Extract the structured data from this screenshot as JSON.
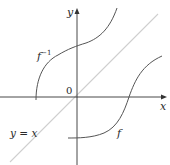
{
  "diagram": {
    "type": "function-and-inverse-graph",
    "axes": {
      "x_label": "x",
      "y_label": "y",
      "origin_label": "0"
    },
    "curves": {
      "identity_label": "y = x",
      "f_label": "f",
      "f_inverse_base": "f",
      "f_inverse_sup": "−1"
    },
    "colors": {
      "axis": "#333333",
      "curve": "#555555",
      "identity_line": "#c8c8c8",
      "text": "#2a2a2a"
    }
  }
}
